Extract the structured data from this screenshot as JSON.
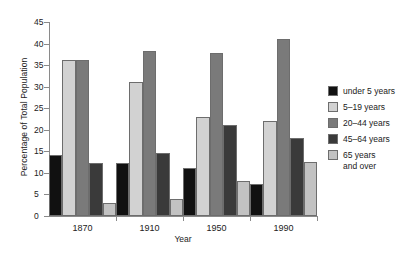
{
  "chart_data": {
    "type": "bar",
    "title": "",
    "xlabel": "Year",
    "ylabel": "Percentage of Total Population",
    "categories": [
      "1870",
      "1910",
      "1950",
      "1990"
    ],
    "ylim": [
      0,
      45
    ],
    "ytick_step": 5,
    "yticks": [
      "0",
      "5",
      "10",
      "15",
      "20",
      "25",
      "30",
      "35",
      "40",
      "45"
    ],
    "grid": false,
    "legend_position": "right",
    "series": [
      {
        "name": "under 5 years",
        "color": "#111111",
        "values": [
          14.2,
          12.2,
          11.2,
          7.5
        ]
      },
      {
        "name": "5–19 years",
        "color": "#d2d2d2",
        "values": [
          36.2,
          31.2,
          23.0,
          22.0
        ]
      },
      {
        "name": "20–44 years",
        "color": "#7a7a7a",
        "values": [
          36.2,
          38.2,
          37.7,
          41.0
        ]
      },
      {
        "name": "45–64 years",
        "color": "#3a3a3a",
        "values": [
          12.3,
          14.6,
          21.0,
          18.2
        ]
      },
      {
        "name": "65 years\nand over",
        "color": "#c2c2c2",
        "values": [
          3.0,
          4.0,
          8.2,
          12.6
        ]
      }
    ]
  }
}
